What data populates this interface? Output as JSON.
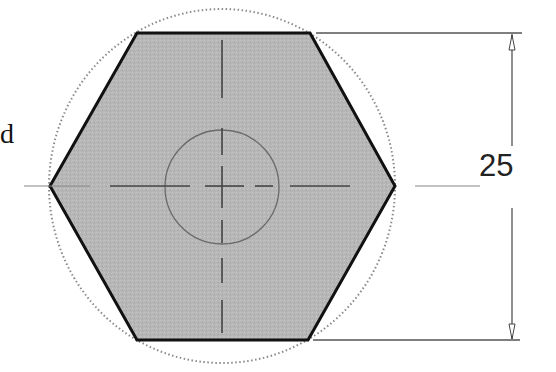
{
  "diagram": {
    "type": "hexagon-drawing",
    "left_text_fragment": "d",
    "dimension": {
      "value": "25",
      "orientation": "vertical",
      "meaning": "across flats"
    },
    "colors": {
      "fill": "#b4b4b4",
      "outline": "#111111",
      "construction_circle": "#888888",
      "center_lines": "#444444",
      "dimension_lines": "#555555"
    },
    "geometry": {
      "center": [
        222,
        186
      ],
      "top_edge_y": 33,
      "bottom_edge_y": 340,
      "left_vertex_x": 50,
      "right_vertex_x": 395,
      "inner_circle_radius": 57
    }
  }
}
